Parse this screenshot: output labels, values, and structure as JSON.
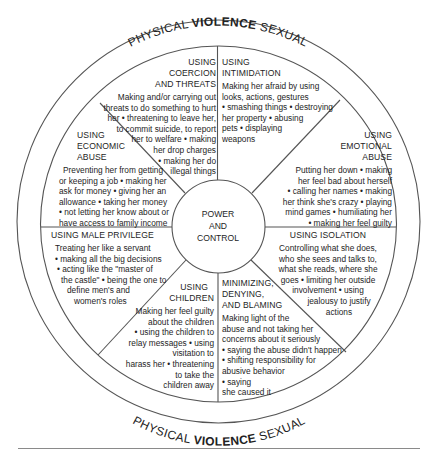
{
  "diagram": {
    "outer_ring": {
      "top_label": {
        "left": "PHYSICAL ",
        "bold": "VIOLENCE",
        "right": " SEXUAL"
      },
      "bottom_label": {
        "left": "PHYSICAL ",
        "bold": "VIOLENCE",
        "right": " SEXUAL"
      }
    },
    "hub": {
      "lines": [
        "POWER",
        "AND",
        "CONTROL"
      ]
    },
    "segments": [
      {
        "id": "coercion-threats",
        "title_lines": [
          "USING",
          "COERCION",
          "AND THREATS"
        ],
        "body_lines": [
          "Making and/or carrying out",
          "threats to do something to hurt",
          "her • threatening to leave her,",
          "to commit suicide, to report",
          "her to welfare • making",
          "her drop charges",
          "• making her do",
          "illegal things"
        ]
      },
      {
        "id": "intimidation",
        "title_lines": [
          "USING",
          "INTIMIDATION"
        ],
        "body_lines": [
          "Making her afraid by using",
          "looks, actions, gestures",
          "• smashing things • destroying",
          "her property • abusing",
          "pets • displaying",
          "weapons"
        ]
      },
      {
        "id": "emotional-abuse",
        "title_lines": [
          "USING",
          "EMOTIONAL",
          "ABUSE"
        ],
        "body_lines": [
          "Putting her down • making",
          "her feel bad about herself",
          "• calling her names • making",
          "her think she's crazy • playing",
          "mind games • humiliating her",
          "• making her feel guilty"
        ]
      },
      {
        "id": "isolation",
        "title_lines": [
          "USING ISOLATION"
        ],
        "body_lines": [
          "Controlling what she does,",
          "who she sees and talks to,",
          "what she reads, where she",
          "goes • limiting her outside",
          "involvement • using",
          "jealousy to justify",
          "actions"
        ]
      },
      {
        "id": "minimizing-denying-blaming",
        "title_lines": [
          "MINIMIZING,",
          "DENYING,",
          "AND BLAMING"
        ],
        "body_lines": [
          "Making light of the",
          "abuse and not taking her",
          "concerns about it seriously",
          "• saying the abuse didn't happen",
          "• shifting responsibility for",
          "abusive behavior",
          "• saying",
          "she caused it"
        ]
      },
      {
        "id": "children",
        "title_lines": [
          "USING",
          "CHILDREN"
        ],
        "body_lines": [
          "Making her feel guilty",
          "about the children",
          "• using the children to",
          "relay messages • using",
          "visitation to",
          "harass her • threatening",
          "to take the",
          "children away"
        ]
      },
      {
        "id": "male-privilege",
        "title_lines": [
          "USING MALE PRIVILEGE"
        ],
        "body_lines": [
          "Treating her like a servant",
          "• making all the big decisions",
          "• acting like the \"master of",
          "the castle\" • being the one to",
          "define men's and",
          "women's roles"
        ]
      },
      {
        "id": "economic-abuse",
        "title_lines": [
          "USING",
          "ECONOMIC",
          "ABUSE"
        ],
        "body_lines": [
          "Preventing her from getting",
          "or keeping a job • making her",
          "ask for money • giving her an",
          "allowance • taking her money",
          "• not letting her know about or",
          "have access to family income"
        ]
      }
    ],
    "colors": {
      "line": "#555555",
      "text": "#1e1e1e",
      "background": "#ffffff",
      "rule": "#8a8a8a"
    }
  }
}
